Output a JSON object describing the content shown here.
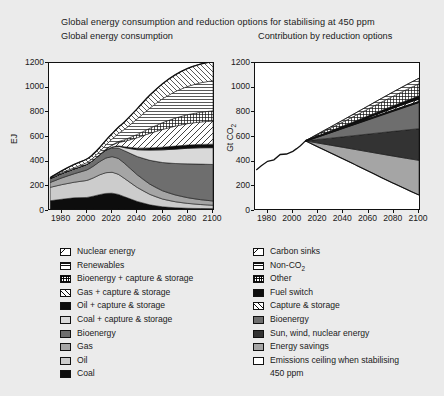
{
  "figure": {
    "title": "Global energy consumption and reduction options for stabilising at 450 ppm",
    "panel_left_title": "Global energy consumption",
    "panel_right_title": "Contribution by reduction options"
  },
  "chart_data": [
    {
      "type": "area",
      "title": "Global energy consumption",
      "xlabel": "",
      "ylabel": "EJ",
      "xlim": [
        1970,
        2100
      ],
      "ylim": [
        0,
        1200
      ],
      "ytick_labels": [
        "0",
        "200",
        "400",
        "600",
        "800",
        "1000",
        "1200"
      ],
      "yticks": [
        0,
        200,
        400,
        600,
        800,
        1000,
        1200
      ],
      "xtick_labels": [
        "1980",
        "2000",
        "2020",
        "2040",
        "2060",
        "2080",
        "2100"
      ],
      "xticks": [
        1980,
        2000,
        2020,
        2040,
        2060,
        2080,
        2100
      ],
      "grid": false,
      "stacked": true,
      "x": [
        1971,
        1980,
        1990,
        2000,
        2005,
        2010,
        2015,
        2020,
        2025,
        2030,
        2040,
        2050,
        2060,
        2070,
        2080,
        2090,
        2100
      ],
      "series": [
        {
          "name": "Coal",
          "fill": "black",
          "values": [
            68,
            80,
            92,
            95,
            105,
            118,
            128,
            130,
            120,
            100,
            62,
            34,
            18,
            10,
            6,
            4,
            3
          ]
        },
        {
          "name": "Oil",
          "fill": "light-grey",
          "values": [
            110,
            120,
            128,
            140,
            150,
            162,
            170,
            172,
            165,
            150,
            115,
            86,
            64,
            50,
            40,
            33,
            28
          ]
        },
        {
          "name": "Gas",
          "fill": "mid-grey",
          "values": [
            40,
            55,
            70,
            86,
            96,
            108,
            120,
            128,
            130,
            124,
            104,
            84,
            68,
            56,
            47,
            40,
            35
          ]
        },
        {
          "name": "Bioenergy",
          "fill": "dark-grey",
          "values": [
            32,
            36,
            40,
            46,
            50,
            56,
            64,
            72,
            86,
            104,
            150,
            196,
            232,
            258,
            278,
            292,
            300
          ]
        },
        {
          "name": "Coal + capture & storage",
          "fill": "pale-grey",
          "values": [
            0,
            0,
            0,
            0,
            0,
            0,
            2,
            6,
            14,
            26,
            56,
            84,
            104,
            118,
            128,
            134,
            138
          ]
        },
        {
          "name": "Oil + capture & storage",
          "fill": "black",
          "values": [
            0,
            0,
            0,
            0,
            0,
            0,
            1,
            2,
            4,
            7,
            13,
            18,
            22,
            25,
            27,
            28,
            29
          ]
        },
        {
          "name": "Gas + capture & storage",
          "fill": "diag-up",
          "values": [
            0,
            0,
            0,
            0,
            0,
            2,
            6,
            14,
            28,
            46,
            86,
            120,
            146,
            164,
            176,
            184,
            190
          ]
        },
        {
          "name": "Bioenergy + capture & storage",
          "fill": "grid",
          "values": [
            0,
            0,
            0,
            0,
            0,
            0,
            1,
            3,
            7,
            13,
            27,
            42,
            56,
            66,
            74,
            80,
            84
          ]
        },
        {
          "name": "Renewables",
          "fill": "horiz",
          "values": [
            6,
            8,
            10,
            14,
            18,
            24,
            34,
            48,
            66,
            86,
            128,
            166,
            196,
            218,
            232,
            242,
            248
          ]
        },
        {
          "name": "Nuclear energy",
          "fill": "diag-down",
          "values": [
            2,
            14,
            26,
            30,
            32,
            34,
            38,
            44,
            52,
            62,
            84,
            106,
            124,
            138,
            148,
            154,
            158
          ]
        }
      ],
      "total_2100": 1100
    },
    {
      "type": "area",
      "title": "Contribution by reduction options",
      "xlabel": "",
      "ylabel": "Gt CO2",
      "ylabel_display": "Gt CO",
      "ylabel_sub": "2",
      "xlim": [
        1970,
        2100
      ],
      "ylim": [
        0,
        1200
      ],
      "ytick_labels": [
        "0",
        "200",
        "400",
        "600",
        "800",
        "1000",
        "1200"
      ],
      "yticks": [
        0,
        200,
        400,
        600,
        800,
        1000,
        1200
      ],
      "xtick_labels": [
        "1980",
        "2000",
        "2020",
        "2040",
        "2060",
        "2080",
        "2100"
      ],
      "xticks": [
        1980,
        2000,
        2020,
        2040,
        2060,
        2080,
        2100
      ],
      "grid": false,
      "baseline_x": [
        1971,
        1975,
        1980,
        1985,
        1990,
        1995,
        2000,
        2003,
        2006,
        2010
      ],
      "baseline_y": [
        320,
        356,
        392,
        404,
        448,
        452,
        474,
        496,
        520,
        560
      ],
      "emissions_ceiling": 880,
      "emissions_ceiling_label": "Emissions ceiling when stabilising 450 ppm",
      "reduction_wedges": [
        {
          "name": "Energy savings",
          "fill": "mid-grey",
          "from_2010": 560,
          "to_2100": 115
        },
        {
          "name": "Sun, wind, nuclear energy",
          "fill": "very-dark",
          "to_2100_top": 400
        },
        {
          "name": "Bioenergy",
          "fill": "dark-grey",
          "to_2100_top": 660
        },
        {
          "name": "Capture & storage",
          "fill": "diag-up",
          "to_2100_top": 880
        },
        {
          "name": "Fuel switch",
          "fill": "black",
          "to_2100_top": 905
        },
        {
          "name": "Other",
          "fill": "grid",
          "to_2100_top": 930
        },
        {
          "name": "Non-CO2",
          "fill": "horiz",
          "to_2100_top": 1030
        },
        {
          "name": "Carbon sinks",
          "fill": "diag-down",
          "to_2100_top": 1075
        }
      ]
    }
  ],
  "legend_left": {
    "items": [
      {
        "label": "Nuclear energy",
        "swatch": "diag-down"
      },
      {
        "label": "Renewables",
        "swatch": "horiz"
      },
      {
        "label": "Bioenergy + capture & storage",
        "swatch": "grid"
      },
      {
        "label": "Gas + capture & storage",
        "swatch": "diag-up"
      },
      {
        "label": "Oil + capture & storage",
        "swatch": "black"
      },
      {
        "label": "Coal + capture & storage",
        "swatch": "pale-grey"
      },
      {
        "label": "Bioenergy",
        "swatch": "dark-grey"
      },
      {
        "label": "Gas",
        "swatch": "mid-grey"
      },
      {
        "label": "Oil",
        "swatch": "light-grey"
      },
      {
        "label": "Coal",
        "swatch": "black"
      }
    ]
  },
  "legend_right": {
    "items": [
      {
        "label": "Carbon sinks",
        "swatch": "diag-down",
        "cont": ""
      },
      {
        "label": "Non-CO2",
        "swatch": "horiz",
        "cont": ""
      },
      {
        "label": "Other",
        "swatch": "grid",
        "cont": ""
      },
      {
        "label": "Fuel switch",
        "swatch": "black",
        "cont": ""
      },
      {
        "label": "Capture & storage",
        "swatch": "diag-up",
        "cont": ""
      },
      {
        "label": "Bioenergy",
        "swatch": "dark-grey",
        "cont": ""
      },
      {
        "label": "Sun, wind, nuclear energy",
        "swatch": "very-dark",
        "cont": ""
      },
      {
        "label": "Energy savings",
        "swatch": "mid-grey",
        "cont": ""
      },
      {
        "label": "Emissions ceiling when stabilising",
        "swatch": "white",
        "cont": "450 ppm"
      }
    ]
  },
  "colors": {
    "background": "#ebebeb",
    "plot_background": "#ffffff",
    "axis": "#111111",
    "black": "#0d0d0d",
    "very_dark": "#333333",
    "dark_grey": "#6e6e6e",
    "mid_grey": "#a5a5a5",
    "light_grey": "#cccccc",
    "pale_grey": "#d9d9d9"
  }
}
